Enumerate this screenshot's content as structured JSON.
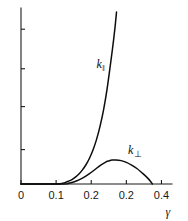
{
  "chart_data": {
    "type": "line",
    "title": "",
    "subtitle": "",
    "xlabel": "γ",
    "ylabel": "",
    "xlim": [
      0,
      0.43
    ],
    "ylim": [
      0,
      1.0
    ],
    "grid": false,
    "legend_position": "inline-annotation",
    "x_ticks": [
      {
        "value": 0,
        "label": "0"
      },
      {
        "value": 0.1,
        "label": "0.1"
      },
      {
        "value": 0.2,
        "label": "0.2"
      },
      {
        "value": 0.3,
        "label": "0.2"
      },
      {
        "value": 0.4,
        "label": "0.4"
      }
    ],
    "y_ticks": [
      {
        "value": 0.2,
        "label": ""
      },
      {
        "value": 0.45,
        "label": ""
      },
      {
        "value": 0.67,
        "label": ""
      },
      {
        "value": 0.9,
        "label": ""
      }
    ],
    "annotations": [
      {
        "name": "k-parallel-label",
        "text": "k",
        "subscript": "‖",
        "x": 0.215,
        "y": 0.73
      },
      {
        "name": "k-perp-label",
        "text": "k",
        "subscript": "⊥",
        "x": 0.305,
        "y": 0.23
      }
    ],
    "series": [
      {
        "name": "k‖",
        "label_text": "k",
        "label_subscript": "‖",
        "color": "#0d0d0d",
        "x": [
          0.0,
          0.1,
          0.115,
          0.125,
          0.135,
          0.145,
          0.155,
          0.165,
          0.175,
          0.185,
          0.195,
          0.205,
          0.215,
          0.225,
          0.235,
          0.245,
          0.255,
          0.262,
          0.268,
          0.272
        ],
        "y": [
          0.0,
          0.0,
          0.003,
          0.008,
          0.016,
          0.026,
          0.04,
          0.058,
          0.082,
          0.112,
          0.15,
          0.198,
          0.258,
          0.335,
          0.43,
          0.55,
          0.7,
          0.81,
          0.915,
          1.0
        ]
      },
      {
        "name": "k⊥",
        "label_text": "k",
        "label_subscript": "⊥",
        "color": "#0d0d0d",
        "x": [
          0.0,
          0.12,
          0.135,
          0.15,
          0.165,
          0.18,
          0.195,
          0.21,
          0.225,
          0.24,
          0.25,
          0.26,
          0.27,
          0.285,
          0.3,
          0.315,
          0.33,
          0.345,
          0.358,
          0.368,
          0.374
        ],
        "y": [
          0.0,
          0.0,
          0.004,
          0.012,
          0.024,
          0.04,
          0.06,
          0.083,
          0.107,
          0.126,
          0.134,
          0.139,
          0.14,
          0.136,
          0.126,
          0.11,
          0.09,
          0.064,
          0.04,
          0.018,
          0.0
        ]
      }
    ]
  }
}
